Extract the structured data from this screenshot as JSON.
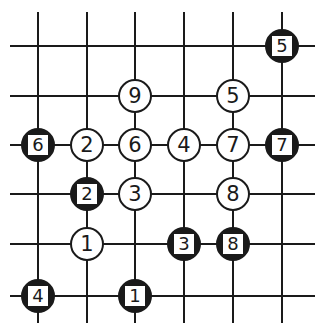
{
  "board": {
    "line_color": "#1a1a1a",
    "cols_x": [
      38,
      87,
      135,
      184,
      233,
      282
    ],
    "rows_y": [
      46,
      96,
      145,
      194,
      244,
      296
    ],
    "h_extent": [
      10,
      315
    ],
    "v_extent": [
      12,
      323
    ]
  },
  "stones": [
    {
      "color": "black",
      "label": "5",
      "col": 5,
      "row": 0
    },
    {
      "color": "white",
      "label": "9",
      "col": 2,
      "row": 1
    },
    {
      "color": "white",
      "label": "5",
      "col": 4,
      "row": 1
    },
    {
      "color": "black",
      "label": "6",
      "col": 0,
      "row": 2
    },
    {
      "color": "white",
      "label": "2",
      "col": 1,
      "row": 2
    },
    {
      "color": "white",
      "label": "6",
      "col": 2,
      "row": 2
    },
    {
      "color": "white",
      "label": "4",
      "col": 3,
      "row": 2
    },
    {
      "color": "white",
      "label": "7",
      "col": 4,
      "row": 2
    },
    {
      "color": "black",
      "label": "7",
      "col": 5,
      "row": 2
    },
    {
      "color": "black",
      "label": "2",
      "col": 1,
      "row": 3
    },
    {
      "color": "white",
      "label": "3",
      "col": 2,
      "row": 3
    },
    {
      "color": "white",
      "label": "8",
      "col": 4,
      "row": 3
    },
    {
      "color": "white",
      "label": "1",
      "col": 1,
      "row": 4
    },
    {
      "color": "black",
      "label": "3",
      "col": 3,
      "row": 4
    },
    {
      "color": "black",
      "label": "8",
      "col": 4,
      "row": 4
    },
    {
      "color": "black",
      "label": "4",
      "col": 0,
      "row": 5
    },
    {
      "color": "black",
      "label": "1",
      "col": 2,
      "row": 5
    }
  ]
}
